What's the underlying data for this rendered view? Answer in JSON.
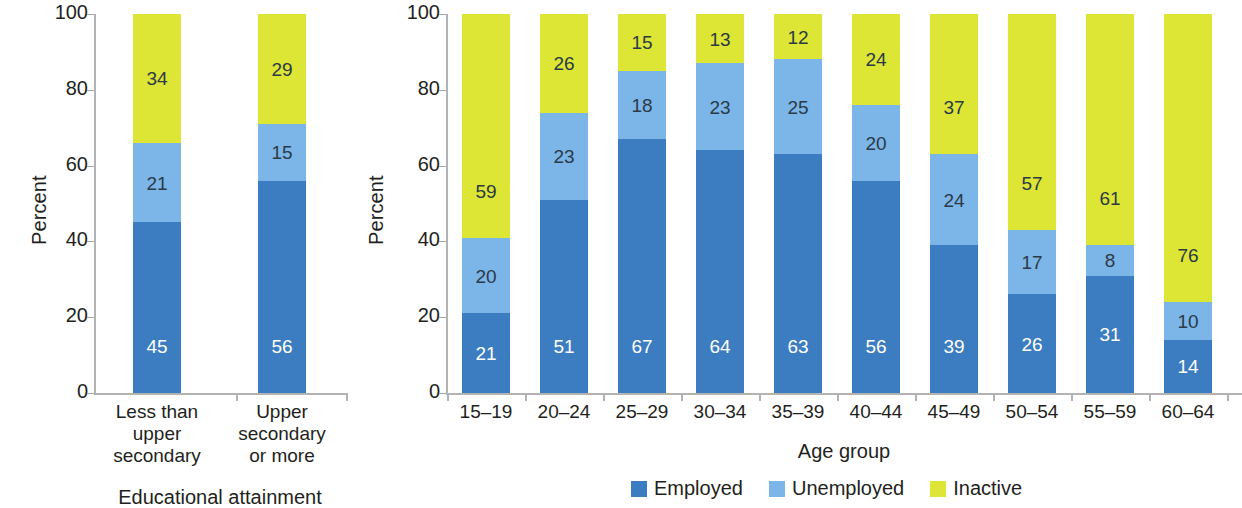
{
  "colors": {
    "employed": "#3c7cc0",
    "unemployed": "#7cb5e8",
    "inactive": "#dde535",
    "axis": "#b3b3b3",
    "tick": "#a8a8a8",
    "text_dark": "#231f20",
    "value_on_dark": "#ffffff",
    "value_on_light": "#2b3a46"
  },
  "legend": {
    "items": [
      {
        "label": "Employed",
        "color": "#3c7cc0",
        "icon": "square-swatch-icon"
      },
      {
        "label": "Unemployed",
        "color": "#7cb5e8",
        "icon": "square-swatch-icon"
      },
      {
        "label": "Inactive",
        "color": "#dde535",
        "icon": "square-swatch-icon"
      }
    ]
  },
  "chart_data": [
    {
      "id": "education-chart",
      "type": "bar",
      "stacked": true,
      "stacked_total": 100,
      "title": "",
      "xlabel": "Educational attainment",
      "ylabel": "Percent",
      "ylim": [
        0,
        100
      ],
      "yticks": [
        0,
        20,
        40,
        60,
        80,
        100
      ],
      "ytick_labels": [
        "0",
        "20",
        "40",
        "60",
        "80",
        "100"
      ],
      "grid": false,
      "legend_position": "none",
      "categories": [
        "Less than\nupper\nsecondary",
        "Upper\nsecondary\nor more"
      ],
      "series": [
        {
          "name": "Employed",
          "color": "#3c7cc0",
          "values": [
            45,
            56
          ]
        },
        {
          "name": "Unemployed",
          "color": "#7cb5e8",
          "values": [
            21,
            15
          ]
        },
        {
          "name": "Inactive",
          "color": "#dde535",
          "values": [
            34,
            29
          ]
        }
      ]
    },
    {
      "id": "age-group-chart",
      "type": "bar",
      "stacked": true,
      "stacked_total": 100,
      "title": "",
      "xlabel": "Age group",
      "ylabel": "Percent",
      "ylim": [
        0,
        100
      ],
      "yticks": [
        0,
        20,
        40,
        60,
        80,
        100
      ],
      "ytick_labels": [
        "0",
        "20",
        "40",
        "60",
        "80",
        "100"
      ],
      "grid": false,
      "legend_position": "bottom",
      "categories": [
        "15–19",
        "20–24",
        "25–29",
        "30–34",
        "35–39",
        "40–44",
        "45–49",
        "50–54",
        "55–59",
        "60–64"
      ],
      "series": [
        {
          "name": "Employed",
          "color": "#3c7cc0",
          "values": [
            21,
            51,
            67,
            64,
            63,
            56,
            39,
            26,
            31,
            14
          ]
        },
        {
          "name": "Unemployed",
          "color": "#7cb5e8",
          "values": [
            20,
            23,
            18,
            23,
            25,
            20,
            24,
            17,
            8,
            10
          ]
        },
        {
          "name": "Inactive",
          "color": "#dde535",
          "values": [
            59,
            26,
            15,
            13,
            12,
            24,
            37,
            57,
            61,
            76
          ]
        }
      ]
    }
  ]
}
